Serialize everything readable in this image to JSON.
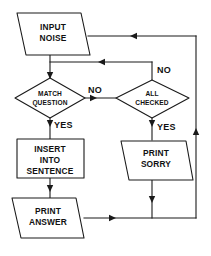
{
  "diagram": {
    "background_color": "#ffffff",
    "line_color": "#1a1a1a",
    "text_color": "#111111",
    "nodes": {
      "input_noise": {
        "shape": "parallelogram",
        "line1": "INPUT",
        "line2": "NOISE"
      },
      "match_question": {
        "shape": "diamond",
        "line1": "MATCH",
        "line2": "QUESTION"
      },
      "all_checked": {
        "shape": "diamond",
        "line1": "ALL",
        "line2": "CHECKED"
      },
      "insert_into_sentence": {
        "shape": "rectangle",
        "line1": "INSERT",
        "line2": "INTO",
        "line3": "SENTENCE"
      },
      "print_sorry": {
        "shape": "parallelogram",
        "line1": "PRINT",
        "line2": "SORRY"
      },
      "print_answer": {
        "shape": "parallelogram",
        "line1": "PRINT",
        "line2": "ANSWER"
      }
    },
    "edge_labels": {
      "match_no": "NO",
      "match_yes": "YES",
      "all_checked_no": "NO",
      "all_checked_yes": "YES"
    }
  }
}
